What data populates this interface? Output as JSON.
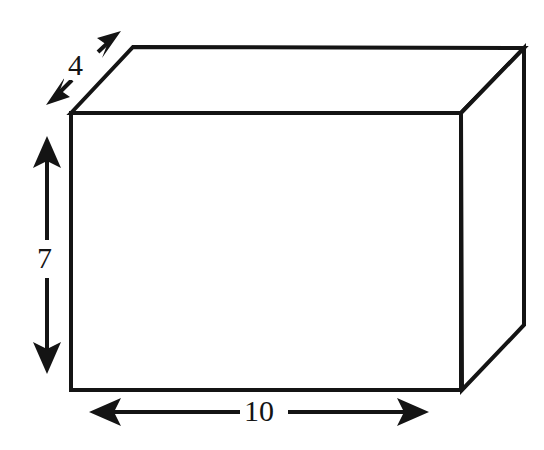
{
  "figure": {
    "name": "rectangular-prism-dimension-diagram",
    "shape": "rectangular prism",
    "background_color": "#ffffff",
    "stroke_color": "#141414",
    "face_fill": "#ffffff"
  },
  "labels": {
    "depth": "4",
    "height": "7",
    "width": "10"
  },
  "dimensions": [
    {
      "name": "width",
      "value": "10",
      "orientation": "horizontal",
      "arrow": "double-headed"
    },
    {
      "name": "height",
      "value": "7",
      "orientation": "vertical",
      "arrow": "double-headed"
    },
    {
      "name": "depth",
      "value": "4",
      "orientation": "diagonal",
      "arrow": "double-headed"
    }
  ],
  "geometry": {
    "front_face": {
      "top_left": [
        71,
        113
      ],
      "top_right": [
        461,
        113
      ],
      "bottom_right": [
        462,
        390
      ],
      "bottom_left": [
        71,
        390
      ]
    },
    "back_offset": {
      "top_left": [
        133,
        47
      ],
      "top_right": [
        524,
        48
      ],
      "bottom_right": [
        524,
        325
      ]
    },
    "arrows": {
      "height": {
        "x": 47,
        "y_top": 138,
        "y_bottom": 372
      },
      "width": {
        "y": 412,
        "x_left": 90,
        "x_right": 428
      },
      "depth": {
        "from": [
          47,
          104
        ],
        "to": [
          120,
          32
        ]
      }
    }
  }
}
